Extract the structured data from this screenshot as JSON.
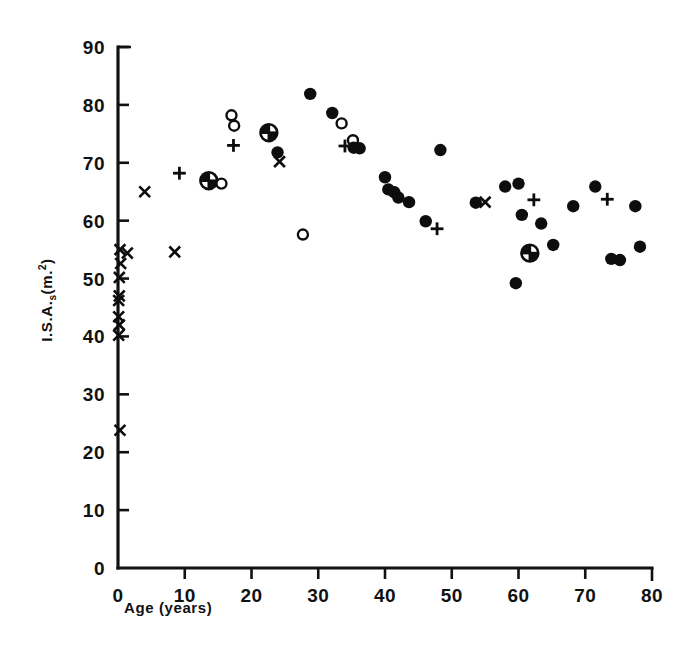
{
  "chart_data": {
    "type": "scatter",
    "title": "",
    "xlabel": "Age (years)",
    "ylabel": "I.S.A.s(m.2)",
    "ylabel_parts": {
      "main": "I.S.A.",
      "sub": "s",
      "tail": "(m.",
      "sup": "2",
      "close": ")"
    },
    "xlim": [
      0,
      80
    ],
    "ylim": [
      0,
      90
    ],
    "xticks": [
      0,
      10,
      20,
      30,
      40,
      50,
      60,
      70,
      80
    ],
    "yticks": [
      0,
      10,
      20,
      30,
      40,
      50,
      60,
      70,
      80,
      90
    ],
    "xtick_labels": [
      "0",
      "10",
      "20",
      "30",
      "40",
      "50",
      "60",
      "70",
      "80"
    ],
    "ytick_labels": [
      "0",
      "10",
      "20",
      "30",
      "40",
      "50",
      "60",
      "70",
      "80",
      "90"
    ],
    "grid": false,
    "legend": "none",
    "series": [
      {
        "name": "cross",
        "marker": "x",
        "points": [
          [
            0.3,
            55.0
          ],
          [
            1.4,
            54.4
          ],
          [
            0.4,
            52.6
          ],
          [
            0.2,
            50.2
          ],
          [
            0.2,
            47.0
          ],
          [
            0.1,
            46.2
          ],
          [
            0.1,
            43.4
          ],
          [
            0.2,
            42.0
          ],
          [
            0.1,
            40.2
          ],
          [
            0.3,
            23.8
          ],
          [
            4.0,
            65.0
          ],
          [
            8.5,
            54.6
          ],
          [
            24.2,
            70.2
          ],
          [
            55.0,
            63.2
          ]
        ]
      },
      {
        "name": "plus",
        "marker": "+",
        "points": [
          [
            9.2,
            68.2
          ],
          [
            17.3,
            73.0
          ],
          [
            34.0,
            72.9
          ],
          [
            47.8,
            58.6
          ],
          [
            62.3,
            63.6
          ],
          [
            73.3,
            63.7
          ]
        ]
      },
      {
        "name": "circled-plus",
        "marker": "circled-plus",
        "points": [
          [
            13.6,
            66.9
          ],
          [
            22.6,
            75.2
          ],
          [
            61.7,
            54.4
          ]
        ]
      },
      {
        "name": "open-circle",
        "marker": "o",
        "points": [
          [
            17.0,
            78.2
          ],
          [
            17.4,
            76.4
          ],
          [
            15.5,
            66.4
          ],
          [
            27.7,
            57.6
          ],
          [
            33.5,
            76.8
          ],
          [
            35.2,
            73.9
          ]
        ]
      },
      {
        "name": "filled-circle",
        "marker": "o-filled",
        "points": [
          [
            28.8,
            81.9
          ],
          [
            23.9,
            71.8
          ],
          [
            32.1,
            78.6
          ],
          [
            35.3,
            72.6
          ],
          [
            36.2,
            72.5
          ],
          [
            40.0,
            67.5
          ],
          [
            40.5,
            65.4
          ],
          [
            41.4,
            64.9
          ],
          [
            42.0,
            64.0
          ],
          [
            43.6,
            63.2
          ],
          [
            46.1,
            59.9
          ],
          [
            48.3,
            72.2
          ],
          [
            53.6,
            63.1
          ],
          [
            58.0,
            65.9
          ],
          [
            60.0,
            66.4
          ],
          [
            60.5,
            61.0
          ],
          [
            59.6,
            49.2
          ],
          [
            63.4,
            59.5
          ],
          [
            65.2,
            55.8
          ],
          [
            68.2,
            62.5
          ],
          [
            71.5,
            65.9
          ],
          [
            73.9,
            53.4
          ],
          [
            75.2,
            53.2
          ],
          [
            77.5,
            62.5
          ],
          [
            78.2,
            55.5
          ]
        ]
      }
    ]
  },
  "figure": {
    "background": "#ffffff",
    "ink": "#0d0d0d"
  }
}
